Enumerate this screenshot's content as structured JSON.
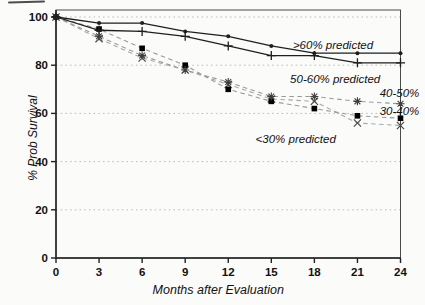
{
  "chart_data": {
    "type": "line",
    "title": "",
    "xlabel": "Months after Evaluation",
    "ylabel": "% Prob Survival",
    "x": [
      0,
      3,
      6,
      9,
      12,
      15,
      18,
      21,
      24
    ],
    "xlim": [
      0,
      24
    ],
    "ylim": [
      0,
      100
    ],
    "x_ticks": [
      "0",
      "3",
      "6",
      "9",
      "12",
      "15",
      "18",
      "21",
      "24"
    ],
    "y_ticks": [
      0,
      20,
      40,
      60,
      80,
      100
    ],
    "grid": "horizontal dotted lines at each labeled y tick",
    "legend_position": "inline text annotations next to curves",
    "series": [
      {
        "name": ">60% predicted",
        "marker": "dot",
        "line_style": "solid",
        "line_color": "#1f1f1f",
        "marker_color": "#1f1f1f",
        "values": [
          100,
          97.5,
          97.5,
          94,
          92,
          88,
          85,
          85,
          85
        ]
      },
      {
        "name": "50-60% predicted",
        "marker": "plus",
        "line_style": "solid",
        "line_color": "#1f1f1f",
        "marker_color": "#1f1f1f",
        "values": [
          100,
          94.5,
          94,
          92,
          88,
          84,
          84,
          81,
          81
        ]
      },
      {
        "name": "40-50%",
        "marker": "asterisk",
        "line_style": "dashed",
        "line_color": "#9a9a9a",
        "marker_color": "#3f3f3f",
        "values": [
          100,
          92,
          84,
          78,
          73,
          67,
          67,
          65,
          64
        ]
      },
      {
        "name": "30-40%",
        "marker": "square",
        "line_style": "dashed",
        "line_color": "#9a9a9a",
        "marker_color": "#000000",
        "values": [
          100,
          95,
          87,
          80,
          70,
          65,
          62,
          59,
          58
        ]
      },
      {
        "name": "<30% predicted",
        "marker": "x",
        "line_style": "dashed",
        "line_color": "#a8a8a8",
        "marker_color": "#4a4a4a",
        "values": [
          100,
          91,
          83,
          78,
          72,
          66,
          65,
          56,
          55
        ]
      }
    ],
    "annotations": [
      {
        "text": ">60% predicted",
        "x": 19.3,
        "y": 86.7,
        "anchor": "middle"
      },
      {
        "text": "50-60% predicted",
        "x": 19.45,
        "y": 72.6,
        "anchor": "middle"
      },
      {
        "text": "40-50%",
        "x": 23.93,
        "y": 66.8,
        "anchor": "middle"
      },
      {
        "text": "30-40%",
        "x": 23.93,
        "y": 59.3,
        "anchor": "middle"
      },
      {
        "text": "<30% predicted",
        "x": 16.7,
        "y": 47.7,
        "anchor": "middle"
      }
    ],
    "layout": {
      "x0": 56,
      "x1": 400.5,
      "y_bottom": 258,
      "y_top": 17,
      "frame_top": 10
    },
    "colors": {
      "grid": "#b8b8b8",
      "frame": "#4a4a4a",
      "text": "#111111"
    }
  }
}
